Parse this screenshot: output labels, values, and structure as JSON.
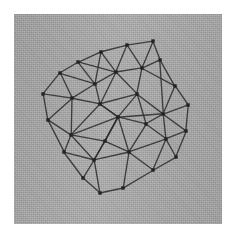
{
  "figure": {
    "canvas": {
      "width": 236,
      "height": 241,
      "background": "#ffffff"
    },
    "panel": {
      "name": "gray-plate",
      "x": 14,
      "y": 14,
      "width": 208,
      "height": 210,
      "fill": "#a9a9a9",
      "texture": "mottled-halftone-grain"
    },
    "styles": {
      "edge_color": "#2f2f2f",
      "edge_width": 1.35,
      "node_color": "#232323",
      "node_size": 3.4
    }
  },
  "chart_data": {
    "type": "graph",
    "xlabel": "",
    "ylabel": "",
    "grid": false,
    "legend": null,
    "node_count": 31,
    "edge_count": 70,
    "layout": "planar-delaunay-triangulation",
    "nodes": [
      {
        "id": 0,
        "name": "top-apex",
        "x": 127,
        "y": 45
      },
      {
        "id": 1,
        "name": "top-right-upper",
        "x": 153,
        "y": 41
      },
      {
        "id": 2,
        "name": "upper-left-a",
        "x": 101,
        "y": 52
      },
      {
        "id": 3,
        "name": "upper-right-a",
        "x": 160,
        "y": 60
      },
      {
        "id": 4,
        "name": "upper-mid",
        "x": 142,
        "y": 68
      },
      {
        "id": 5,
        "name": "left-upper-a",
        "x": 78,
        "y": 62
      },
      {
        "id": 6,
        "name": "upper-left-inner",
        "x": 116,
        "y": 72
      },
      {
        "id": 7,
        "name": "right-upper-b",
        "x": 175,
        "y": 86
      },
      {
        "id": 8,
        "name": "left-upper-b",
        "x": 60,
        "y": 73
      },
      {
        "id": 9,
        "name": "inner-upper-left",
        "x": 95,
        "y": 84
      },
      {
        "id": 10,
        "name": "inner-upper-right",
        "x": 137,
        "y": 94
      },
      {
        "id": 11,
        "name": "left-edge-top",
        "x": 43,
        "y": 94
      },
      {
        "id": 12,
        "name": "left-inner-a",
        "x": 72,
        "y": 98
      },
      {
        "id": 13,
        "name": "inner-left-mid",
        "x": 100,
        "y": 104
      },
      {
        "id": 14,
        "name": "right-edge-a",
        "x": 188,
        "y": 105
      },
      {
        "id": 15,
        "name": "hub-center",
        "x": 118,
        "y": 117
      },
      {
        "id": 16,
        "name": "right-inner-a",
        "x": 163,
        "y": 114
      },
      {
        "id": 17,
        "name": "left-edge-mid",
        "x": 48,
        "y": 120
      },
      {
        "id": 18,
        "name": "inner-mid-right",
        "x": 146,
        "y": 124
      },
      {
        "id": 19,
        "name": "right-edge-b",
        "x": 186,
        "y": 131
      },
      {
        "id": 20,
        "name": "left-inner-b",
        "x": 71,
        "y": 135
      },
      {
        "id": 21,
        "name": "inner-lower-left",
        "x": 105,
        "y": 141
      },
      {
        "id": 22,
        "name": "right-inner-b",
        "x": 166,
        "y": 139
      },
      {
        "id": 23,
        "name": "lower-left-a",
        "x": 64,
        "y": 152
      },
      {
        "id": 24,
        "name": "inner-lower-mid",
        "x": 129,
        "y": 152
      },
      {
        "id": 25,
        "name": "right-lower-a",
        "x": 176,
        "y": 157
      },
      {
        "id": 26,
        "name": "lower-mid-left",
        "x": 94,
        "y": 160
      },
      {
        "id": 27,
        "name": "lower-right-a",
        "x": 153,
        "y": 170
      },
      {
        "id": 28,
        "name": "lower-left-b",
        "x": 83,
        "y": 178
      },
      {
        "id": 29,
        "name": "bottom-apex",
        "x": 100,
        "y": 193
      },
      {
        "id": 30,
        "name": "bottom-right",
        "x": 123,
        "y": 188
      }
    ],
    "edges": [
      [
        0,
        1
      ],
      [
        0,
        2
      ],
      [
        0,
        4
      ],
      [
        0,
        6
      ],
      [
        1,
        3
      ],
      [
        1,
        4
      ],
      [
        2,
        5
      ],
      [
        2,
        6
      ],
      [
        2,
        9
      ],
      [
        3,
        4
      ],
      [
        3,
        7
      ],
      [
        3,
        16
      ],
      [
        4,
        6
      ],
      [
        4,
        10
      ],
      [
        4,
        7
      ],
      [
        5,
        8
      ],
      [
        5,
        9
      ],
      [
        5,
        6
      ],
      [
        6,
        9
      ],
      [
        6,
        10
      ],
      [
        6,
        13
      ],
      [
        7,
        14
      ],
      [
        7,
        16
      ],
      [
        8,
        11
      ],
      [
        8,
        12
      ],
      [
        8,
        9
      ],
      [
        9,
        12
      ],
      [
        9,
        13
      ],
      [
        10,
        13
      ],
      [
        10,
        15
      ],
      [
        10,
        16
      ],
      [
        10,
        18
      ],
      [
        11,
        12
      ],
      [
        11,
        17
      ],
      [
        12,
        13
      ],
      [
        12,
        17
      ],
      [
        12,
        20
      ],
      [
        13,
        15
      ],
      [
        13,
        20
      ],
      [
        14,
        16
      ],
      [
        14,
        19
      ],
      [
        15,
        16
      ],
      [
        15,
        18
      ],
      [
        15,
        20
      ],
      [
        15,
        21
      ],
      [
        15,
        24
      ],
      [
        15,
        26
      ],
      [
        15,
        13
      ],
      [
        16,
        18
      ],
      [
        16,
        19
      ],
      [
        16,
        22
      ],
      [
        17,
        20
      ],
      [
        17,
        23
      ],
      [
        18,
        22
      ],
      [
        18,
        24
      ],
      [
        19,
        22
      ],
      [
        19,
        25
      ],
      [
        20,
        21
      ],
      [
        20,
        23
      ],
      [
        20,
        26
      ],
      [
        21,
        24
      ],
      [
        21,
        26
      ],
      [
        21,
        15
      ],
      [
        22,
        25
      ],
      [
        22,
        27
      ],
      [
        22,
        24
      ],
      [
        23,
        26
      ],
      [
        23,
        28
      ],
      [
        24,
        27
      ],
      [
        24,
        30
      ],
      [
        24,
        26
      ],
      [
        25,
        27
      ],
      [
        26,
        28
      ],
      [
        26,
        29
      ],
      [
        27,
        30
      ],
      [
        28,
        29
      ],
      [
        29,
        30
      ]
    ]
  }
}
